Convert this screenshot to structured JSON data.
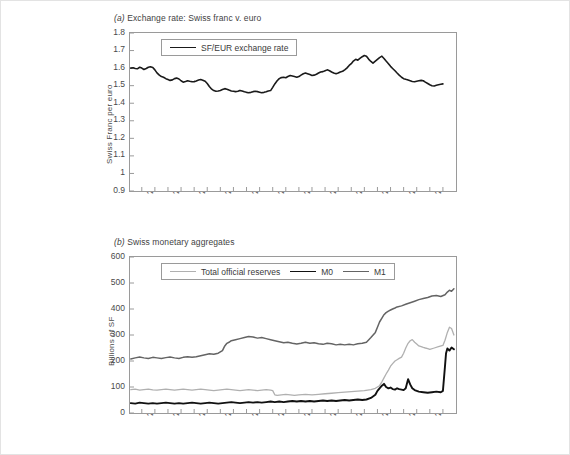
{
  "figure": {
    "background": "#ffffff",
    "border_color": "#e3e3e3"
  },
  "panel_a": {
    "title_prefix": "(a)",
    "title": " Exchange rate: Swiss franc v. euro",
    "legend": [
      {
        "label": "SF/EUR exchange rate",
        "color": "#1a1a1a",
        "width": 1.6
      }
    ]
  },
  "panel_b": {
    "title_prefix": "(b)",
    "title": " Swiss monetary aggregates",
    "legend": [
      {
        "label": "Total official reserves",
        "color": "#b0b0b0",
        "width": 1.3
      },
      {
        "label": "M0",
        "color": "#111111",
        "width": 1.9
      },
      {
        "label": "M1",
        "color": "#646464",
        "width": 1.6
      }
    ]
  },
  "chart_data": [
    {
      "id": "panel-a",
      "type": "line",
      "title": "(a) Exchange rate: Swiss franc v. euro",
      "xlabel": "",
      "ylabel": "Swiss Franc per euro",
      "ylim": [
        0.9,
        1.8
      ],
      "yticks": [
        0.9,
        1,
        1.1,
        1.2,
        1.3,
        1.4,
        1.5,
        1.6,
        1.7,
        1.8
      ],
      "ytick_labels": [
        "0.9",
        "1",
        "1.1",
        "1.2",
        "1.3",
        "1.4",
        "1.5",
        "1.6",
        "1.7",
        "1.8"
      ],
      "xlim": [
        1999.55,
        2012.0
      ],
      "xticks": [
        2000,
        2001,
        2002,
        2003,
        2004,
        2005,
        2006,
        2007,
        2008,
        2009,
        2010,
        2011
      ],
      "xtick_labels": [
        "2000",
        "2001",
        "2002",
        "2003",
        "2004",
        "2005",
        "2006",
        "2007",
        "2008",
        "2009",
        "2010",
        "2011"
      ],
      "grid": false,
      "legend_position": "upper-left",
      "series": [
        {
          "name": "SF/EUR exchange rate",
          "color": "#1a1a1a",
          "x": [
            1999.58,
            1999.67,
            1999.75,
            1999.83,
            1999.92,
            2000.0,
            2000.08,
            2000.17,
            2000.25,
            2000.33,
            2000.42,
            2000.5,
            2000.58,
            2000.67,
            2000.75,
            2000.83,
            2000.92,
            2001.0,
            2001.08,
            2001.17,
            2001.25,
            2001.33,
            2001.42,
            2001.5,
            2001.58,
            2001.67,
            2001.75,
            2001.83,
            2001.92,
            2002.0,
            2002.08,
            2002.17,
            2002.25,
            2002.33,
            2002.42,
            2002.5,
            2002.58,
            2002.67,
            2002.75,
            2002.83,
            2002.92,
            2003.0,
            2003.08,
            2003.17,
            2003.25,
            2003.33,
            2003.42,
            2003.5,
            2003.58,
            2003.67,
            2003.75,
            2003.83,
            2003.92,
            2004.0,
            2004.08,
            2004.17,
            2004.25,
            2004.33,
            2004.42,
            2004.5,
            2004.58,
            2004.67,
            2004.75,
            2004.83,
            2004.92,
            2005.0,
            2005.08,
            2005.17,
            2005.25,
            2005.33,
            2005.42,
            2005.5,
            2005.58,
            2005.67,
            2005.75,
            2005.83,
            2005.92,
            2006.0,
            2006.08,
            2006.17,
            2006.25,
            2006.33,
            2006.42,
            2006.5,
            2006.58,
            2006.67,
            2006.75,
            2006.83,
            2006.92,
            2007.0,
            2007.08,
            2007.17,
            2007.25,
            2007.33,
            2007.42,
            2007.5,
            2007.58,
            2007.67,
            2007.75,
            2007.83,
            2007.92,
            2008.0,
            2008.08,
            2008.17,
            2008.25,
            2008.33,
            2008.42,
            2008.5,
            2008.58,
            2008.67,
            2008.75,
            2008.83,
            2008.92,
            2009.0,
            2009.08,
            2009.17,
            2009.25,
            2009.33,
            2009.42,
            2009.5,
            2009.58,
            2009.67,
            2009.75,
            2009.83,
            2009.92,
            2010.0,
            2010.08,
            2010.17,
            2010.25,
            2010.33,
            2010.42,
            2010.5,
            2010.58,
            2010.67,
            2010.75,
            2010.83,
            2010.92,
            2011.0,
            2011.08,
            2011.17,
            2011.25,
            2011.33,
            2011.42,
            2011.5,
            2011.58,
            2011.67,
            2011.75,
            2011.83,
            2011.92
          ],
          "y": [
            1.6,
            1.602,
            1.598,
            1.596,
            1.605,
            1.6,
            1.592,
            1.598,
            1.605,
            1.608,
            1.604,
            1.59,
            1.573,
            1.56,
            1.552,
            1.548,
            1.54,
            1.535,
            1.53,
            1.533,
            1.54,
            1.543,
            1.538,
            1.528,
            1.52,
            1.524,
            1.528,
            1.525,
            1.522,
            1.523,
            1.527,
            1.532,
            1.535,
            1.531,
            1.525,
            1.512,
            1.495,
            1.48,
            1.472,
            1.468,
            1.47,
            1.473,
            1.478,
            1.483,
            1.48,
            1.475,
            1.47,
            1.468,
            1.466,
            1.468,
            1.473,
            1.47,
            1.465,
            1.462,
            1.46,
            1.462,
            1.466,
            1.468,
            1.466,
            1.463,
            1.46,
            1.462,
            1.465,
            1.47,
            1.472,
            1.49,
            1.51,
            1.528,
            1.54,
            1.546,
            1.548,
            1.545,
            1.552,
            1.558,
            1.555,
            1.552,
            1.548,
            1.552,
            1.56,
            1.568,
            1.572,
            1.568,
            1.563,
            1.558,
            1.56,
            1.565,
            1.572,
            1.578,
            1.58,
            1.585,
            1.59,
            1.585,
            1.578,
            1.572,
            1.568,
            1.572,
            1.578,
            1.582,
            1.59,
            1.6,
            1.615,
            1.625,
            1.64,
            1.65,
            1.645,
            1.655,
            1.665,
            1.672,
            1.668,
            1.65,
            1.638,
            1.628,
            1.64,
            1.65,
            1.66,
            1.668,
            1.655,
            1.64,
            1.625,
            1.61,
            1.598,
            1.585,
            1.572,
            1.56,
            1.548,
            1.54,
            1.536,
            1.532,
            1.528,
            1.524,
            1.522,
            1.525,
            1.528,
            1.53,
            1.528,
            1.52,
            1.512,
            1.505,
            1.5,
            1.498,
            1.502,
            1.505,
            1.508,
            1.51
          ]
        }
      ]
    },
    {
      "id": "panel-b",
      "type": "line",
      "title": "(b) Swiss monetary aggregates",
      "xlabel": "",
      "ylabel": "Billions of SF",
      "ylim": [
        0,
        600
      ],
      "yticks": [
        0,
        100,
        200,
        300,
        400,
        500,
        600
      ],
      "ytick_labels": [
        "0",
        "100",
        "200",
        "300",
        "400",
        "500",
        "600"
      ],
      "xlim": [
        1999.55,
        2012.0
      ],
      "xticks": [
        2000,
        2001,
        2002,
        2003,
        2004,
        2005,
        2006,
        2007,
        2008,
        2009,
        2010,
        2011
      ],
      "xtick_labels": [
        "2000",
        "2001",
        "2002",
        "2003",
        "2004",
        "2005",
        "2006",
        "2007",
        "2008",
        "2009",
        "2010",
        "2011"
      ],
      "grid": false,
      "legend_position": "upper-left",
      "series": [
        {
          "name": "Total official reserves",
          "color": "#b0b0b0",
          "x": [
            1999.58,
            1999.75,
            1999.92,
            2000.08,
            2000.25,
            2000.42,
            2000.58,
            2000.75,
            2000.92,
            2001.08,
            2001.25,
            2001.42,
            2001.58,
            2001.75,
            2001.92,
            2002.08,
            2002.25,
            2002.42,
            2002.58,
            2002.75,
            2002.92,
            2003.08,
            2003.25,
            2003.42,
            2003.58,
            2003.75,
            2003.92,
            2004.08,
            2004.25,
            2004.42,
            2004.58,
            2004.75,
            2004.92,
            2005.0,
            2005.08,
            2005.17,
            2005.33,
            2005.5,
            2005.67,
            2005.83,
            2006.0,
            2006.25,
            2006.5,
            2006.75,
            2007.0,
            2007.25,
            2007.5,
            2007.75,
            2008.0,
            2008.25,
            2008.5,
            2008.75,
            2008.92,
            2009.08,
            2009.17,
            2009.25,
            2009.33,
            2009.42,
            2009.5,
            2009.58,
            2009.67,
            2009.75,
            2009.83,
            2009.92,
            2010.0,
            2010.08,
            2010.17,
            2010.25,
            2010.33,
            2010.42,
            2010.5,
            2010.58,
            2010.67,
            2010.75,
            2010.83,
            2010.92,
            2011.0,
            2011.17,
            2011.33,
            2011.5,
            2011.58,
            2011.67,
            2011.75,
            2011.83,
            2011.92
          ],
          "y": [
            90,
            92,
            88,
            90,
            92,
            89,
            88,
            90,
            92,
            90,
            88,
            90,
            92,
            90,
            88,
            90,
            92,
            90,
            88,
            86,
            88,
            90,
            92,
            90,
            88,
            86,
            88,
            90,
            88,
            86,
            88,
            90,
            88,
            86,
            70,
            68,
            70,
            72,
            70,
            68,
            70,
            72,
            70,
            72,
            74,
            76,
            78,
            80,
            82,
            84,
            86,
            90,
            95,
            105,
            120,
            135,
            150,
            165,
            180,
            190,
            200,
            205,
            210,
            215,
            230,
            250,
            268,
            278,
            282,
            272,
            265,
            258,
            255,
            252,
            250,
            248,
            245,
            250,
            255,
            260,
            280,
            310,
            330,
            325,
            300
          ]
        },
        {
          "name": "M0",
          "color": "#111111",
          "x": [
            1999.58,
            1999.75,
            1999.92,
            2000.08,
            2000.25,
            2000.42,
            2000.58,
            2000.75,
            2000.92,
            2001.08,
            2001.25,
            2001.42,
            2001.58,
            2001.75,
            2001.92,
            2002.08,
            2002.25,
            2002.42,
            2002.58,
            2002.75,
            2002.92,
            2003.08,
            2003.25,
            2003.42,
            2003.58,
            2003.75,
            2003.92,
            2004.08,
            2004.25,
            2004.42,
            2004.58,
            2004.75,
            2004.92,
            2005.08,
            2005.25,
            2005.42,
            2005.58,
            2005.75,
            2005.92,
            2006.08,
            2006.25,
            2006.42,
            2006.58,
            2006.75,
            2006.92,
            2007.08,
            2007.25,
            2007.42,
            2007.58,
            2007.75,
            2007.92,
            2008.08,
            2008.25,
            2008.42,
            2008.58,
            2008.75,
            2008.92,
            2009.0,
            2009.08,
            2009.17,
            2009.25,
            2009.33,
            2009.42,
            2009.5,
            2009.58,
            2009.67,
            2009.75,
            2009.83,
            2009.92,
            2010.0,
            2010.08,
            2010.17,
            2010.25,
            2010.33,
            2010.42,
            2010.5,
            2010.58,
            2010.75,
            2010.92,
            2011.08,
            2011.25,
            2011.42,
            2011.5,
            2011.58,
            2011.62,
            2011.67,
            2011.75,
            2011.83,
            2011.92
          ],
          "y": [
            38,
            36,
            40,
            38,
            36,
            38,
            36,
            38,
            40,
            38,
            36,
            38,
            36,
            38,
            40,
            38,
            36,
            38,
            40,
            38,
            36,
            38,
            40,
            42,
            40,
            38,
            40,
            42,
            40,
            42,
            40,
            42,
            44,
            42,
            44,
            42,
            44,
            46,
            44,
            46,
            44,
            46,
            44,
            46,
            48,
            46,
            48,
            46,
            48,
            50,
            48,
            50,
            52,
            50,
            52,
            58,
            70,
            85,
            95,
            105,
            112,
            100,
            95,
            98,
            92,
            90,
            95,
            92,
            90,
            88,
            95,
            130,
            110,
            95,
            88,
            85,
            82,
            80,
            78,
            80,
            82,
            80,
            85,
            180,
            230,
            248,
            240,
            252,
            245
          ]
        },
        {
          "name": "M1",
          "color": "#646464",
          "x": [
            1999.58,
            1999.75,
            1999.92,
            2000.08,
            2000.25,
            2000.42,
            2000.58,
            2000.75,
            2000.92,
            2001.08,
            2001.25,
            2001.42,
            2001.58,
            2001.75,
            2001.92,
            2002.08,
            2002.25,
            2002.42,
            2002.58,
            2002.75,
            2002.92,
            2003.08,
            2003.17,
            2003.25,
            2003.33,
            2003.42,
            2003.58,
            2003.75,
            2003.92,
            2004.08,
            2004.25,
            2004.42,
            2004.58,
            2004.75,
            2004.92,
            2005.08,
            2005.25,
            2005.42,
            2005.58,
            2005.75,
            2005.92,
            2006.08,
            2006.25,
            2006.42,
            2006.58,
            2006.75,
            2006.92,
            2007.08,
            2007.25,
            2007.42,
            2007.58,
            2007.75,
            2007.92,
            2008.08,
            2008.25,
            2008.42,
            2008.58,
            2008.75,
            2008.92,
            2009.0,
            2009.08,
            2009.17,
            2009.25,
            2009.33,
            2009.42,
            2009.5,
            2009.58,
            2009.67,
            2009.75,
            2009.92,
            2010.08,
            2010.25,
            2010.42,
            2010.58,
            2010.75,
            2010.92,
            2011.08,
            2011.25,
            2011.42,
            2011.58,
            2011.67,
            2011.75,
            2011.83,
            2011.92
          ],
          "y": [
            208,
            212,
            215,
            212,
            210,
            214,
            212,
            210,
            213,
            215,
            212,
            210,
            214,
            216,
            214,
            216,
            220,
            224,
            228,
            226,
            230,
            240,
            258,
            268,
            272,
            278,
            282,
            286,
            290,
            294,
            292,
            288,
            290,
            286,
            282,
            278,
            274,
            270,
            272,
            268,
            265,
            268,
            272,
            268,
            270,
            266,
            264,
            268,
            266,
            262,
            264,
            262,
            264,
            262,
            266,
            268,
            272,
            290,
            310,
            330,
            350,
            365,
            378,
            386,
            392,
            396,
            400,
            404,
            408,
            412,
            418,
            424,
            430,
            436,
            440,
            444,
            450,
            452,
            448,
            455,
            465,
            472,
            468,
            478
          ]
        }
      ]
    }
  ]
}
